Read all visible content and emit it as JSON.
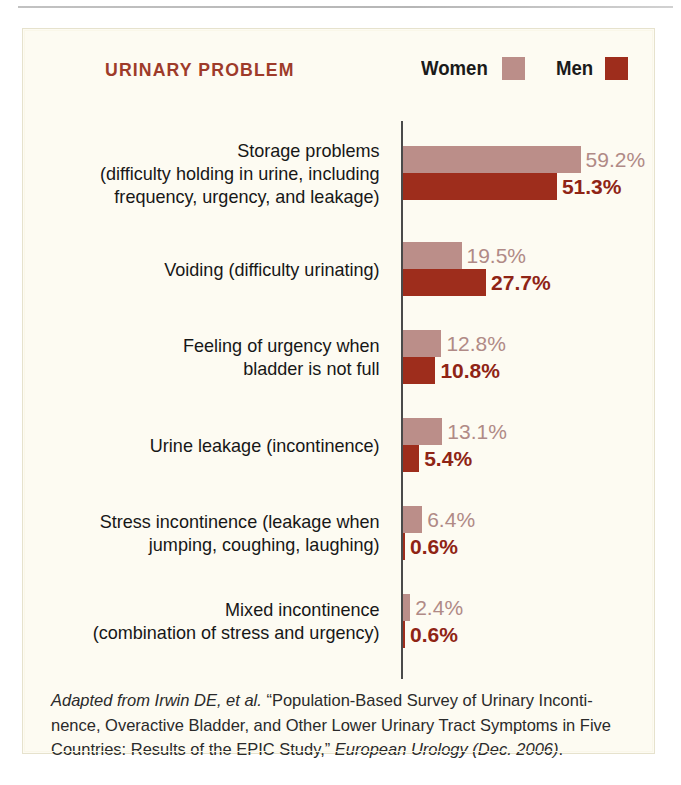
{
  "chart_data": {
    "type": "bar",
    "orientation": "horizontal",
    "title": "URINARY PROBLEM",
    "xlabel": "",
    "ylabel": "",
    "xlim": [
      0,
      60
    ],
    "grid": false,
    "legend_position": "top-right",
    "value_suffix": "%",
    "px_per_percent": 3.0,
    "categories": [
      "Storage problems (difficulty holding in urine, including frequency, urgency, and leakage)",
      "Voiding (difficulty urinating)",
      "Feeling of urgency when bladder is not full",
      "Urine leakage (incontinence)",
      "Stress incontinence (leakage when jumping, coughing, laughing)",
      "Mixed incontinence (combination of stress and urgency)"
    ],
    "series": [
      {
        "name": "Women",
        "color": "#bb8e89",
        "values": [
          59.2,
          19.5,
          12.8,
          13.1,
          6.4,
          2.4
        ]
      },
      {
        "name": "Men",
        "color": "#9e2d1c",
        "values": [
          51.3,
          27.7,
          10.8,
          5.4,
          0.6,
          0.6
        ]
      }
    ]
  },
  "legend": {
    "women_label": "Women",
    "men_label": "Men",
    "women_color": "#bb8e89",
    "men_color": "#9e2d1c"
  },
  "rows": [
    {
      "label_lines": [
        "Storage problems",
        "(difficulty holding in urine, including",
        "frequency, urgency, and leakage)"
      ],
      "women_value": 59.2,
      "women_text": "59.2%",
      "men_value": 51.3,
      "men_text": "51.3%"
    },
    {
      "label_lines": [
        "Voiding (difficulty urinating)"
      ],
      "women_value": 19.5,
      "women_text": "19.5%",
      "men_value": 27.7,
      "men_text": "27.7%"
    },
    {
      "label_lines": [
        "Feeling of urgency when",
        "bladder is not full"
      ],
      "women_value": 12.8,
      "women_text": "12.8%",
      "men_value": 10.8,
      "men_text": "10.8%"
    },
    {
      "label_lines": [
        "Urine leakage (incontinence)"
      ],
      "women_value": 13.1,
      "women_text": "13.1%",
      "men_value": 5.4,
      "men_text": "5.4%"
    },
    {
      "label_lines": [
        "Stress incontinence (leakage when",
        "jumping, coughing, laughing)"
      ],
      "women_value": 6.4,
      "women_text": "6.4%",
      "men_value": 0.6,
      "men_text": "0.6%"
    },
    {
      "label_lines": [
        "Mixed incontinence",
        "(combination of stress and urgency)"
      ],
      "women_value": 2.4,
      "women_text": "2.4%",
      "men_value": 0.6,
      "men_text": "0.6%"
    }
  ],
  "footer": {
    "lead_italic": "Adapted from Irwin DE, et al.",
    "body_1": " “Population-Based Survey of Urinary Inconti-nence, Overactive Bladder, and Other Lower Urinary Tract Symptoms in Five Countries: Results of the EPIC Study,” ",
    "journal_italic": "European Urology (Dec. 2006)",
    "body_2": "."
  }
}
